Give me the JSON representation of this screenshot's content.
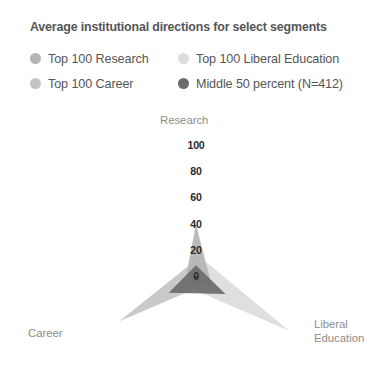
{
  "chart": {
    "title": "Average institutional directions for select segments"
  },
  "legend": {
    "position": "top",
    "items": [
      {
        "label": "Top 100 Research",
        "color": "#b4b4b4"
      },
      {
        "label": "Top 100 Liberal Education",
        "color": "#dcdcdc"
      },
      {
        "label": "Top 100 Career",
        "color": "#c4c4c4"
      },
      {
        "label": "Middle 50 percent (N=412)",
        "color": "#6b6b6b"
      }
    ]
  },
  "axis_names": {
    "research": "Research",
    "career": "Career",
    "liberal_line1": "Liberal",
    "liberal_line2": "Education"
  },
  "ticks": [
    {
      "label": "100",
      "value": 100
    },
    {
      "label": "80",
      "value": 80
    },
    {
      "label": "60",
      "value": 60
    },
    {
      "label": "40",
      "value": 40
    },
    {
      "label": "20",
      "value": 20
    },
    {
      "label": "0",
      "value": 0
    }
  ],
  "chart_data": {
    "type": "radar",
    "title": "Average institutional directions for select segments",
    "xlabel": "",
    "ylabel": "",
    "categories": [
      "Research",
      "Liberal Education",
      "Career"
    ],
    "rlim": [
      0,
      100
    ],
    "rticks": [
      0,
      20,
      40,
      60,
      80,
      100
    ],
    "grid": false,
    "legend_position": "top",
    "angles_deg": {
      "Research": 90,
      "Liberal Education": -30,
      "Career": 210
    },
    "series": [
      {
        "name": "Top 100 Research",
        "color": "#b4b4b4",
        "values": [
          40,
          14,
          10
        ]
      },
      {
        "name": "Top 100 Liberal Education",
        "color": "#dcdcdc",
        "values": [
          18,
          82,
          12
        ]
      },
      {
        "name": "Top 100 Career",
        "color": "#c4c4c4",
        "values": [
          13,
          10,
          68
        ]
      },
      {
        "name": "Middle 50 percent (N=412)",
        "color": "#6b6b6b",
        "values": [
          9,
          26,
          24
        ]
      }
    ]
  },
  "geometry": {
    "center_x": 196,
    "center_y": 177,
    "radius_100": 131
  }
}
